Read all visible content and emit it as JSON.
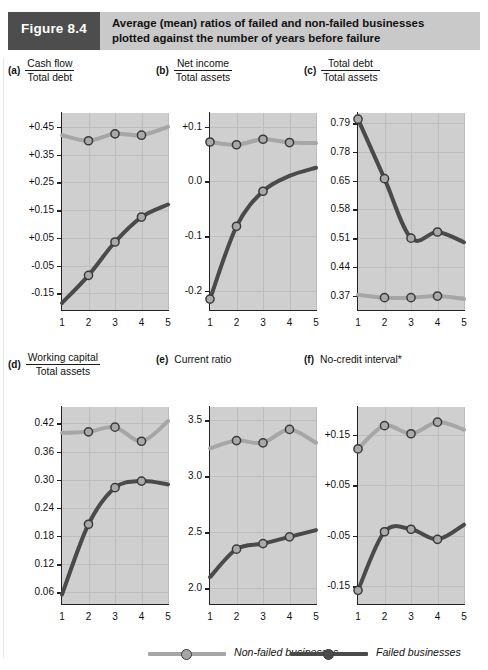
{
  "figure": {
    "tag": "Figure 8.4",
    "title_line1": "Average (mean) ratios of failed and non-failed businesses",
    "title_line2": "plotted against the number of years before failure",
    "tag_bg": "#4d4d4d",
    "banner_bg": "#c9c9c9"
  },
  "legend": {
    "items": [
      {
        "label": "Non-failed businesses",
        "color": "#a6a6a6"
      },
      {
        "label": "Failed businesses",
        "color": "#4a4a4a"
      }
    ]
  },
  "series_colors": {
    "non_failed": "#a6a6a6",
    "failed": "#4a4a4a"
  },
  "xaxis": {
    "ticks": [
      "1",
      "2",
      "3",
      "4",
      "5"
    ],
    "min": 1,
    "max": 5
  },
  "chart_data": [
    {
      "type": "line",
      "panel": "(a)",
      "title_numerator": "Cash flow",
      "title_denominator": "Total debt",
      "title": "Cash flow / Total debt",
      "xlabel": "",
      "ylabel": "",
      "x": [
        1,
        2,
        3,
        4,
        5
      ],
      "yticks": [
        "+0.45",
        "+0.35",
        "+0.25",
        "+0.15",
        "+0.05",
        "-0.05",
        "-0.15"
      ],
      "ytickvals": [
        0.45,
        0.35,
        0.25,
        0.15,
        0.05,
        -0.05,
        -0.15
      ],
      "ylim": [
        -0.21,
        0.5
      ],
      "grid": true,
      "series": [
        {
          "name": "Non-failed businesses",
          "values": [
            0.42,
            0.4,
            0.425,
            0.42,
            0.45
          ],
          "markers": [
            false,
            true,
            true,
            true,
            false
          ]
        },
        {
          "name": "Failed businesses",
          "values": [
            -0.185,
            -0.085,
            0.035,
            0.125,
            0.17
          ],
          "markers": [
            false,
            true,
            true,
            true,
            false
          ]
        }
      ]
    },
    {
      "type": "line",
      "panel": "(b)",
      "title_numerator": "Net income",
      "title_denominator": "Total assets",
      "title": "Net income / Total assets",
      "xlabel": "",
      "ylabel": "",
      "x": [
        1,
        2,
        3,
        4,
        5
      ],
      "yticks": [
        "+0.1",
        "0.0",
        "-0.1",
        "-0.2"
      ],
      "ytickvals": [
        0.1,
        0.0,
        -0.1,
        -0.2
      ],
      "ylim": [
        -0.235,
        0.125
      ],
      "grid": true,
      "series": [
        {
          "name": "Non-failed businesses",
          "values": [
            0.072,
            0.067,
            0.077,
            0.071,
            0.07
          ],
          "markers": [
            true,
            true,
            true,
            true,
            false
          ]
        },
        {
          "name": "Failed businesses",
          "values": [
            -0.215,
            -0.082,
            -0.018,
            0.01,
            0.025
          ],
          "markers": [
            true,
            true,
            true,
            false,
            false
          ]
        }
      ]
    },
    {
      "type": "line",
      "panel": "(c)",
      "title_numerator": "Total debt",
      "title_denominator": "Total assets",
      "title": "Total debt / Total assets",
      "xlabel": "",
      "ylabel": "",
      "x": [
        1,
        2,
        3,
        4,
        5
      ],
      "yticks": [
        "0.79",
        "0.78",
        "0.65",
        "0.58",
        "0.51",
        "0.44",
        "0.37"
      ],
      "ytickvals": [
        0.79,
        0.72,
        0.65,
        0.58,
        0.51,
        0.44,
        0.37
      ],
      "ylim": [
        0.335,
        0.815
      ],
      "grid": true,
      "series": [
        {
          "name": "Failed businesses",
          "values": [
            0.8,
            0.655,
            0.51,
            0.525,
            0.5
          ],
          "markers": [
            true,
            true,
            true,
            true,
            false
          ]
        },
        {
          "name": "Non-failed businesses",
          "values": [
            0.372,
            0.365,
            0.365,
            0.369,
            0.362
          ],
          "markers": [
            false,
            true,
            true,
            true,
            false
          ]
        }
      ]
    },
    {
      "type": "line",
      "panel": "(d)",
      "title_numerator": "Working capital",
      "title_denominator": "Total assets",
      "title": "Working capital / Total assets",
      "xlabel": "",
      "ylabel": "",
      "x": [
        1,
        2,
        3,
        4,
        5
      ],
      "yticks": [
        "0.42",
        "0.36",
        "0.30",
        "0.24",
        "0.18",
        "0.12",
        "0.06"
      ],
      "ytickvals": [
        0.42,
        0.36,
        0.3,
        0.24,
        0.18,
        0.12,
        0.06
      ],
      "ylim": [
        0.035,
        0.455
      ],
      "grid": true,
      "series": [
        {
          "name": "Non-failed businesses",
          "values": [
            0.4,
            0.402,
            0.412,
            0.382,
            0.425
          ],
          "markers": [
            false,
            true,
            true,
            true,
            false
          ]
        },
        {
          "name": "Failed businesses",
          "values": [
            0.055,
            0.205,
            0.283,
            0.297,
            0.29
          ],
          "markers": [
            false,
            true,
            true,
            true,
            false
          ]
        }
      ]
    },
    {
      "type": "line",
      "panel": "(e)",
      "title_numerator": "",
      "title_denominator": "",
      "title": "Current ratio",
      "xlabel": "",
      "ylabel": "",
      "x": [
        1,
        2,
        3,
        4,
        5
      ],
      "yticks": [
        "3.5",
        "3.0",
        "2.5",
        "2.0"
      ],
      "ytickvals": [
        3.5,
        3.0,
        2.5,
        2.0
      ],
      "ylim": [
        1.86,
        3.62
      ],
      "grid": true,
      "series": [
        {
          "name": "Non-failed businesses",
          "values": [
            3.25,
            3.32,
            3.3,
            3.42,
            3.3
          ],
          "markers": [
            false,
            true,
            true,
            true,
            false
          ]
        },
        {
          "name": "Failed businesses",
          "values": [
            2.1,
            2.35,
            2.4,
            2.46,
            2.52
          ],
          "markers": [
            false,
            true,
            true,
            true,
            false
          ]
        }
      ]
    },
    {
      "type": "line",
      "panel": "(f)",
      "title_numerator": "",
      "title_denominator": "",
      "title": "No-credit interval*",
      "xlabel": "",
      "ylabel": "",
      "x": [
        1,
        2,
        3,
        4,
        5
      ],
      "yticks": [
        "+0.15",
        "+0.05",
        "-0.05",
        "-0.15"
      ],
      "ytickvals": [
        0.15,
        0.05,
        -0.05,
        -0.15
      ],
      "ylim": [
        -0.185,
        0.205
      ],
      "grid": true,
      "series": [
        {
          "name": "Non-failed businesses",
          "values": [
            0.122,
            0.168,
            0.152,
            0.175,
            0.16
          ],
          "markers": [
            true,
            true,
            true,
            true,
            false
          ]
        },
        {
          "name": "Failed businesses",
          "values": [
            -0.158,
            -0.042,
            -0.037,
            -0.057,
            -0.028
          ],
          "markers": [
            true,
            true,
            true,
            true,
            false
          ]
        }
      ]
    }
  ]
}
